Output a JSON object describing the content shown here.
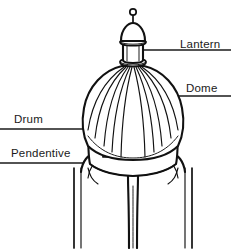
{
  "figure": {
    "style": "black-ink-line-art",
    "background_color": "#ffffff",
    "ink_color": "#111111",
    "text_color": "#1a1a1a",
    "width": 231,
    "height": 249
  },
  "labels": [
    {
      "id": "lantern",
      "text": "Lantern",
      "text_x": 180,
      "text_y": 48,
      "anchor": "start",
      "leader_from_x": 133,
      "leader_from_y": 50,
      "leader_to_x": 231,
      "leader_to_y": 50,
      "side": "right"
    },
    {
      "id": "dome",
      "text": "Dome",
      "text_x": 186,
      "text_y": 92,
      "anchor": "start",
      "leader_from_x": 131,
      "leader_from_y": 96,
      "leader_to_x": 231,
      "leader_to_y": 96,
      "side": "right"
    },
    {
      "id": "drum",
      "text": "Drum",
      "text_x": 14,
      "text_y": 123,
      "anchor": "start",
      "leader_from_x": 0,
      "leader_from_y": 129,
      "leader_to_x": 99,
      "leader_to_y": 129,
      "side": "left"
    },
    {
      "id": "pendentive",
      "text": "Pendentive",
      "text_x": 11,
      "text_y": 157,
      "anchor": "start",
      "leader_from_x": 0,
      "leader_from_y": 163,
      "leader_to_x": 84,
      "leader_to_y": 163,
      "side": "left"
    }
  ],
  "parts": {
    "finial": {
      "name": "finial-ball",
      "cx": 133,
      "cy": 19,
      "r": 3
    },
    "finial_stem": {
      "name": "finial-stem",
      "x": 133,
      "y_top": 22,
      "y_bottom": 31
    },
    "lantern_cap": {
      "name": "lantern-cap-dome",
      "cx": 133,
      "cy": 41,
      "rx": 13,
      "ry": 13
    },
    "lantern_body": {
      "name": "lantern-drum",
      "cx": 133,
      "y_top": 44,
      "y_bottom": 62,
      "half_width": 11
    },
    "dome": {
      "name": "ribbed-dome",
      "cx": 133,
      "cy": 131,
      "rx": 52,
      "ry": 67,
      "rib_count": 11
    },
    "drum": {
      "name": "drum-wall",
      "cx": 133,
      "y_top": 120,
      "y_bottom": 168,
      "half_width": 45
    },
    "drum_window": {
      "name": "drum-arched-window",
      "x": 103,
      "y": 131,
      "w": 9,
      "h": 26
    },
    "pendentives": {
      "name": "pendentive-arches",
      "arch_count": 2,
      "pier_count": 3
    },
    "piers": {
      "name": "support-piers",
      "left_x": 78,
      "center_x": 133,
      "right_x": 188,
      "y_bottom": 248
    }
  }
}
